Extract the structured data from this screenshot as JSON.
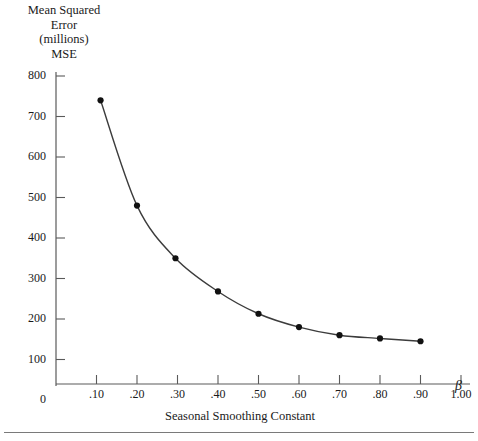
{
  "chart_data": {
    "type": "line",
    "title": "",
    "ylabel_lines": [
      "Mean Squared",
      "Error",
      "(millions)",
      "MSE"
    ],
    "xlabel": "Seasonal Smoothing Constant",
    "x_symbol": "β",
    "x": [
      0.11,
      0.2,
      0.295,
      0.4,
      0.5,
      0.6,
      0.7,
      0.8,
      0.9
    ],
    "values": [
      740,
      480,
      350,
      268,
      213,
      180,
      160,
      152,
      145
    ],
    "series": [
      {
        "name": "MSE",
        "x": [
          0.11,
          0.2,
          0.295,
          0.4,
          0.5,
          0.6,
          0.7,
          0.8,
          0.9
        ],
        "values": [
          740,
          480,
          350,
          268,
          213,
          180,
          160,
          152,
          145
        ]
      }
    ],
    "xlim": [
      0,
      1.0
    ],
    "ylim": [
      0,
      800
    ],
    "ytick_values": [
      0,
      100,
      200,
      300,
      400,
      500,
      600,
      700,
      800
    ],
    "ytick_labels": [
      "0",
      "100",
      "200",
      "300",
      "400",
      "500",
      "600",
      "700",
      "800"
    ],
    "xtick_values": [
      0.1,
      0.2,
      0.3,
      0.4,
      0.5,
      0.6,
      0.7,
      0.8,
      0.9,
      1.0
    ],
    "xtick_labels": [
      ".10",
      ".20",
      ".30",
      ".40",
      ".50",
      ".60",
      ".70",
      ".80",
      ".90",
      "1.00"
    ],
    "grid": false,
    "legend": null,
    "marker": "filled-circle",
    "line_color": "#3c3c3c",
    "marker_color": "#111111",
    "axis_color": "#5a5a5a"
  }
}
